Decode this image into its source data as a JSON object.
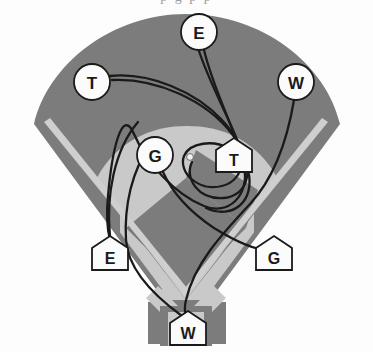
{
  "page": {
    "title_partial": "p g p p",
    "width": 373,
    "height": 352,
    "background": "#ffffff"
  },
  "colors": {
    "grass": "#7c7c7c",
    "grass_dark": "#6f6f6f",
    "infield_dirt": "#c9c9c9",
    "foul_line": "#cfcfcf",
    "path_line": "#1a1a1a",
    "marker_fill": "#fbfbfb",
    "marker_stroke": "#1a1a1a",
    "label_text": "#1a1a1a",
    "page_background": "#ffffff"
  },
  "field": {
    "name": "baseball-diamond",
    "outfield_shape": "rounded-arc-diamond",
    "infield_shape": "dirt-arc-with-grass-diamond",
    "has_foul_lines": true,
    "has_pitchers_mound": true,
    "home_plate_notch": true
  },
  "markers": {
    "circles": [
      {
        "id": "circle-e",
        "label": "E",
        "x": 199,
        "y": 32,
        "r": 18
      },
      {
        "id": "circle-t",
        "label": "T",
        "x": 92,
        "y": 82,
        "r": 18
      },
      {
        "id": "circle-w",
        "label": "W",
        "x": 296,
        "y": 82,
        "r": 18
      },
      {
        "id": "circle-g",
        "label": "G",
        "x": 155,
        "y": 155,
        "r": 18
      }
    ],
    "pentagons": [
      {
        "id": "pentagon-t",
        "label": "T",
        "x": 234,
        "y": 155,
        "w": 36,
        "h": 34
      },
      {
        "id": "pentagon-e",
        "label": "E",
        "x": 110,
        "y": 253,
        "w": 36,
        "h": 34
      },
      {
        "id": "pentagon-g",
        "label": "G",
        "x": 274,
        "y": 253,
        "w": 36,
        "h": 34
      },
      {
        "id": "pentagon-w",
        "label": "W",
        "x": 188,
        "y": 328,
        "w": 36,
        "h": 34
      }
    ]
  },
  "paths": [
    {
      "id": "path-e",
      "label": "E",
      "from": "circle-e",
      "to": "pentagon-e"
    },
    {
      "id": "path-t",
      "label": "T",
      "from": "circle-t",
      "to": "pentagon-t"
    },
    {
      "id": "path-w",
      "label": "W",
      "from": "circle-w",
      "to": "pentagon-w"
    },
    {
      "id": "path-g",
      "label": "G",
      "from": "circle-g",
      "to": "pentagon-g"
    }
  ]
}
